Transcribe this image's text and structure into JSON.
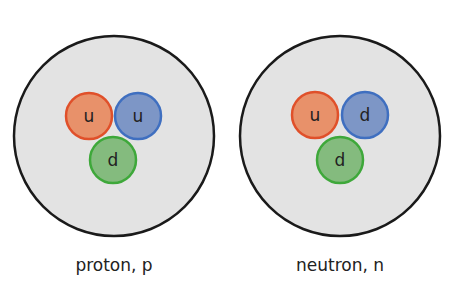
{
  "colors": {
    "background": "#ffffff",
    "particle_fill": "#e3e3e3",
    "particle_stroke": "#1a1a1a",
    "up_red_fill": "#e8916a",
    "up_red_stroke": "#e0502a",
    "blue_fill": "#7d96c6",
    "blue_stroke": "#3f6fc0",
    "green_fill": "#84bb7e",
    "green_stroke": "#3ea83a",
    "quark_text": "#222222"
  },
  "particles": [
    {
      "name": "proton",
      "label": "proton, p",
      "quarks": [
        {
          "flavor": "u",
          "color": "red"
        },
        {
          "flavor": "u",
          "color": "blue"
        },
        {
          "flavor": "d",
          "color": "green"
        }
      ]
    },
    {
      "name": "neutron",
      "label": "neutron, n",
      "quarks": [
        {
          "flavor": "u",
          "color": "red"
        },
        {
          "flavor": "d",
          "color": "blue"
        },
        {
          "flavor": "d",
          "color": "green"
        }
      ]
    }
  ]
}
